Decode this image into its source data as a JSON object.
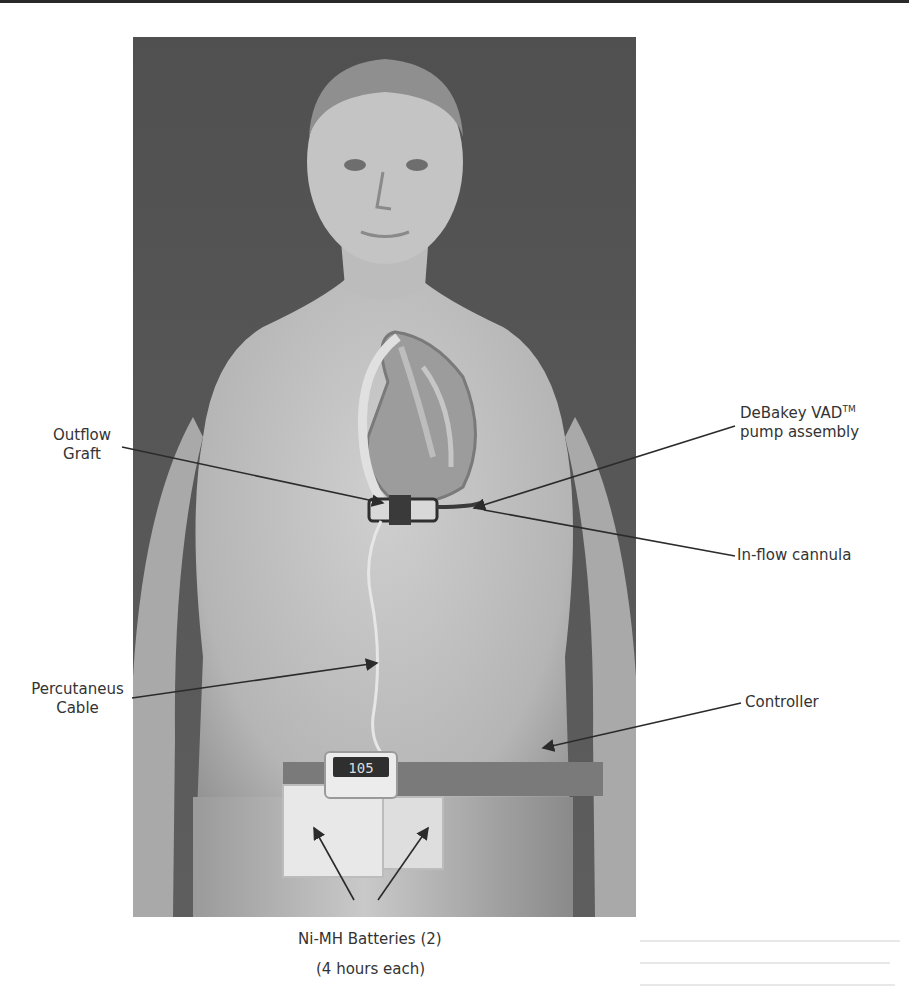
{
  "figure": {
    "colors": {
      "background": "#ffffff",
      "illustration_bg": "#555555",
      "skin": "#bdbdbd",
      "label_text": "#333333",
      "leader_line": "#2b2b2b"
    },
    "controller_display": "105",
    "labels": {
      "outflow_graft": {
        "line1": "Outflow",
        "line2": "Graft"
      },
      "pump_assembly": {
        "line1_pre": "DeBakey VAD",
        "line1_sup": "TM",
        "line2": "pump assembly"
      },
      "inflow_cannula": {
        "text": "In-flow cannula"
      },
      "percutaneous_cable": {
        "line1": "Percutaneus",
        "line2": "Cable"
      },
      "controller": {
        "text": "Controller"
      },
      "batteries": {
        "line1": "Ni-MH Batteries (2)",
        "line2": "(4 hours each)"
      }
    }
  }
}
